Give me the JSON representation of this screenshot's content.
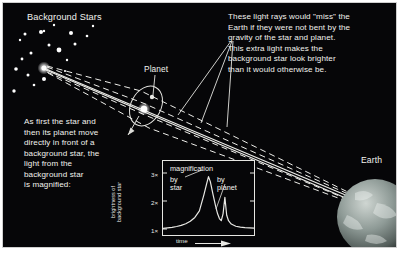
{
  "figure": {
    "name": "gravitational-microlensing-by-star-and-planet",
    "background_color": "#060608",
    "ink_color": "#f2f2ee",
    "frame_color": "#cfcfcf"
  },
  "labels": {
    "background_stars": "Background Stars",
    "planet": "Planet",
    "earth": "Earth"
  },
  "annotations": {
    "rays_note": "These light rays would \"miss\" the\nEarth if they were not bent by the\ngravity of the star and planet.\nThis extra light makes the\nbackground star look brighter\nthan it would otherwise be.",
    "magnified_note": "As first the star and\nthen its planet move\ndirectly in front of a\nbackground star, the\nlight from the\nbackground star\nis magnified:"
  },
  "chart_data": {
    "type": "line",
    "title": "magnification",
    "xlabel": "time",
    "ylabel": "brightness of background star",
    "ytick_labels": [
      "1×",
      "2×",
      "3×"
    ],
    "ytick_values": [
      1,
      2,
      3
    ],
    "ylim": [
      1,
      3.25
    ],
    "xlim": [
      0,
      100
    ],
    "grid": false,
    "legend_position": "inside-top",
    "annotations": [
      {
        "name": "by-star",
        "text": "by\nstar",
        "points_to": "main-peak"
      },
      {
        "name": "by-planet",
        "text": "by\nplanet",
        "points_to": "planet-spike"
      }
    ],
    "series": [
      {
        "name": "magnification",
        "x": [
          0,
          5,
          10,
          15,
          20,
          25,
          30,
          35,
          40,
          45,
          48,
          50,
          52,
          55,
          58,
          60,
          62,
          64,
          66,
          68,
          70,
          72,
          75,
          80,
          85,
          90,
          95,
          100
        ],
        "y": [
          1.02,
          1.04,
          1.06,
          1.09,
          1.13,
          1.19,
          1.28,
          1.42,
          1.66,
          2.25,
          2.65,
          2.9,
          2.72,
          2.25,
          1.8,
          1.55,
          1.38,
          1.3,
          1.55,
          2.15,
          1.5,
          1.3,
          1.18,
          1.1,
          1.07,
          1.05,
          1.04,
          1.03
        ]
      }
    ]
  },
  "scene": {
    "source_star": {
      "name": "background-source-star",
      "x": 41,
      "y": 65
    },
    "lens_star": {
      "name": "lensing-star",
      "x": 141,
      "y": 106
    },
    "planet_dot": {
      "name": "planet-body",
      "x": 148,
      "y": 95
    },
    "earth": {
      "name": "earth-globe",
      "x": 370,
      "y": 212,
      "radius": 38
    },
    "stars": [
      {
        "x": 22,
        "y": 31,
        "r": 1.5
      },
      {
        "x": 38,
        "y": 29,
        "r": 2.0
      },
      {
        "x": 41,
        "y": 28,
        "r": 1.2
      },
      {
        "x": 68,
        "y": 30,
        "r": 2.0
      },
      {
        "x": 84,
        "y": 33,
        "r": 1.3
      },
      {
        "x": 17,
        "y": 37,
        "r": 1.2
      },
      {
        "x": 46,
        "y": 42,
        "r": 1.5
      },
      {
        "x": 72,
        "y": 41,
        "r": 1.5
      },
      {
        "x": 56,
        "y": 47,
        "r": 2.4
      },
      {
        "x": 28,
        "y": 50,
        "r": 1.5
      },
      {
        "x": 19,
        "y": 56,
        "r": 1.4
      },
      {
        "x": 64,
        "y": 57,
        "r": 1.2
      },
      {
        "x": 13,
        "y": 66,
        "r": 1.8
      },
      {
        "x": 25,
        "y": 72,
        "r": 1.5
      },
      {
        "x": 41,
        "y": 76,
        "r": 2.0
      },
      {
        "x": 31,
        "y": 82,
        "r": 1.3
      },
      {
        "x": 11,
        "y": 88,
        "r": 1.7
      },
      {
        "x": 51,
        "y": 22,
        "r": 1.2
      },
      {
        "x": 90,
        "y": 23,
        "r": 1.2
      },
      {
        "x": 62,
        "y": 68,
        "r": 1.1
      }
    ]
  }
}
